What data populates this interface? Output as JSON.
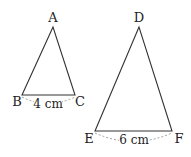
{
  "diagram": {
    "type": "similar-triangles",
    "triangles": [
      {
        "id": "ABC",
        "vertices": {
          "A": [
            53,
            27
          ],
          "B": [
            22,
            95
          ],
          "C": [
            75,
            95
          ]
        },
        "labels": {
          "A": "A",
          "B": "B",
          "C": "C"
        },
        "base_measure": "4 cm"
      },
      {
        "id": "DEF",
        "vertices": {
          "D": [
            139,
            27
          ],
          "E": [
            95,
            131
          ],
          "F": [
            172,
            131
          ]
        },
        "labels": {
          "D": "D",
          "E": "E",
          "F": "F"
        },
        "base_measure": "6 cm"
      }
    ],
    "colors": {
      "stroke": "#333333",
      "dash": "#888888",
      "text": "#222222"
    }
  }
}
